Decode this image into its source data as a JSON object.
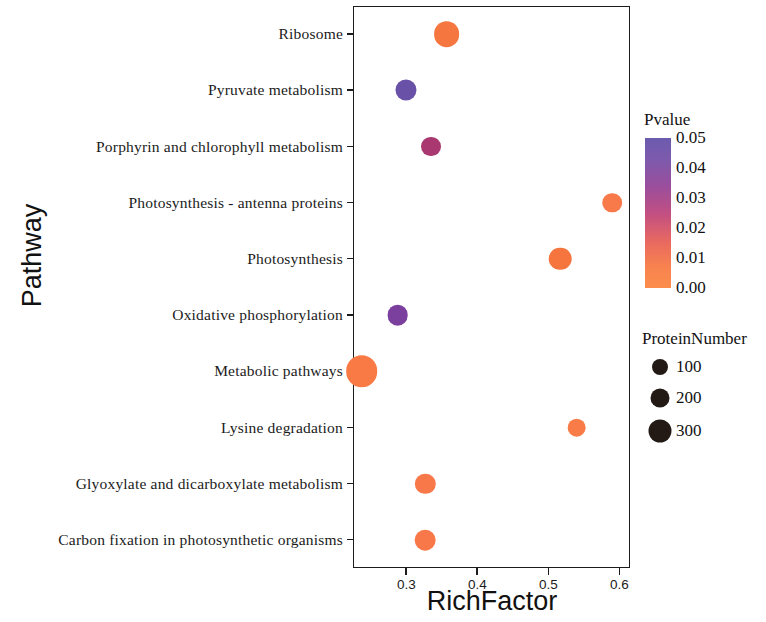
{
  "chart_data": {
    "type": "scatter",
    "title": "",
    "xlabel": "RichFactor",
    "ylabel": "Pathway",
    "xlim": [
      0.225,
      0.615
    ],
    "xticks": [
      "0.3",
      "0.4",
      "0.5",
      "0.6"
    ],
    "xtick_values": [
      0.3,
      0.4,
      0.5,
      0.6
    ],
    "grid": false,
    "categories": [
      "Ribosome",
      "Pyruvate metabolism",
      "Porphyrin and chlorophyll metabolism",
      "Photosynthesis - antenna proteins",
      "Photosynthesis",
      "Oxidative phosphorylation",
      "Metabolic pathways",
      "Lysine degradation",
      "Glyoxylate and dicarboxylate metabolism",
      "Carbon fixation in photosynthetic organisms"
    ],
    "points": [
      {
        "pathway": "Ribosome",
        "rich_factor": 0.357,
        "pvalue": 0.002,
        "protein_number": 150,
        "color": "#f5763f"
      },
      {
        "pathway": "Pyruvate metabolism",
        "rich_factor": 0.3,
        "pvalue": 0.048,
        "protein_number": 60,
        "color": "#6a51a8"
      },
      {
        "pathway": "Porphyrin and chlorophyll metabolism",
        "rich_factor": 0.335,
        "pvalue": 0.026,
        "protein_number": 45,
        "color": "#a8386f"
      },
      {
        "pathway": "Photosynthesis - antenna proteins",
        "rich_factor": 0.59,
        "pvalue": 0.002,
        "protein_number": 40,
        "color": "#f8794a"
      },
      {
        "pathway": "Photosynthesis",
        "rich_factor": 0.517,
        "pvalue": 0.002,
        "protein_number": 85,
        "color": "#f6743d"
      },
      {
        "pathway": "Oxidative phosphorylation",
        "rich_factor": 0.288,
        "pvalue": 0.04,
        "protein_number": 55,
        "color": "#7b3f9e"
      },
      {
        "pathway": "Metabolic pathways",
        "rich_factor": 0.237,
        "pvalue": 0.0,
        "protein_number": 320,
        "color": "#f97a45"
      },
      {
        "pathway": "Lysine degradation",
        "rich_factor": 0.54,
        "pvalue": 0.004,
        "protein_number": 30,
        "color": "#f97b47"
      },
      {
        "pathway": "Glyoxylate and dicarboxylate metabolism",
        "rich_factor": 0.327,
        "pvalue": 0.003,
        "protein_number": 50,
        "color": "#f8784a"
      },
      {
        "pathway": "Carbon fixation in photosynthetic organisms",
        "rich_factor": 0.327,
        "pvalue": 0.003,
        "protein_number": 55,
        "color": "#f8784a"
      }
    ],
    "color_legend": {
      "title": "Pvalue",
      "ticks": [
        "0.05",
        "0.04",
        "0.03",
        "0.02",
        "0.01",
        "0.00"
      ],
      "tick_values": [
        0.05,
        0.04,
        0.03,
        0.02,
        0.01,
        0.0
      ],
      "high_color": "#6b5bae",
      "low_color": "#fb8d4c"
    },
    "size_legend": {
      "title": "ProteinNumber",
      "ticks": [
        "100",
        "200",
        "300"
      ],
      "tick_values": [
        100,
        200,
        300
      ],
      "color": "#231a16"
    }
  }
}
